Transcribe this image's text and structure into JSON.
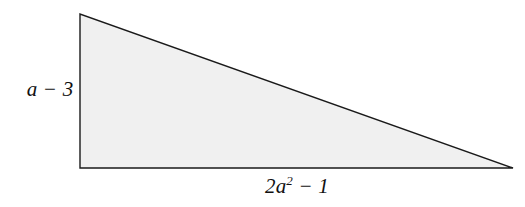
{
  "figure": {
    "type": "right-triangle-diagram",
    "background_color": "#ffffff",
    "fill_color": "#f0f0f0",
    "stroke_color": "#1a1a1a",
    "stroke_width": 1.4,
    "vertices": {
      "apex": {
        "x": 80,
        "y": 14
      },
      "bottom_left": {
        "x": 80,
        "y": 168
      },
      "bottom_right": {
        "x": 513,
        "y": 168
      }
    },
    "labels": {
      "height": {
        "text": "a − 3",
        "a": "a",
        "operator": "−",
        "constant": "3",
        "position": "left-of-vertical-leg"
      },
      "base": {
        "prefix": "2a",
        "exponent": "2",
        "suffix": " − 1",
        "text": "2a2 − 1",
        "position": "below-horizontal-base"
      }
    }
  }
}
